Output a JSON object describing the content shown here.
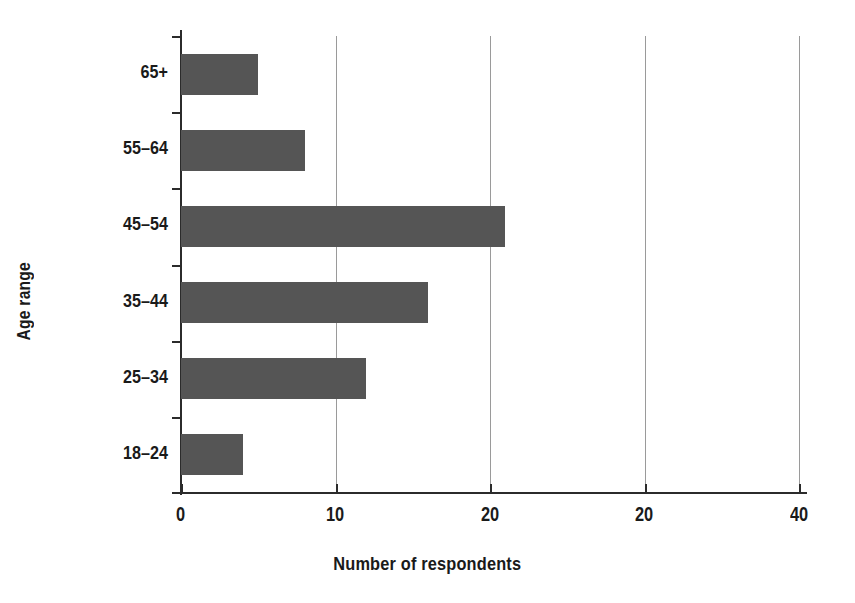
{
  "chart_data": {
    "type": "bar",
    "orientation": "horizontal",
    "title": "",
    "xlabel": "Number of respondents",
    "ylabel": "Age range",
    "categories": [
      "18-24",
      "25-34",
      "35-44",
      "45-54",
      "55-64",
      "65+"
    ],
    "values": [
      4,
      12,
      16,
      21,
      8,
      5
    ],
    "series": [
      {
        "name": "Number of respondents",
        "values": [
          4,
          12,
          16,
          21,
          8,
          5
        ]
      }
    ],
    "xlim": [
      0,
      40
    ],
    "xticks": [
      0,
      10,
      20,
      30,
      40
    ],
    "xticklabels": [
      "0",
      "10",
      "20",
      "20",
      "40"
    ],
    "grid": true,
    "grid_axis": "x",
    "legend": false,
    "bar_color": "#555555",
    "axis_color": "#2b2b2b",
    "gridline_color": "#9a9a9a",
    "background_color": "#ffffff"
  }
}
